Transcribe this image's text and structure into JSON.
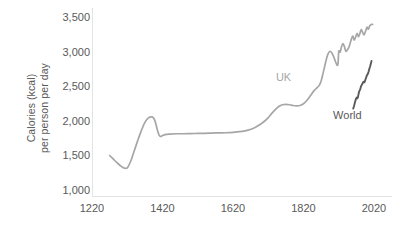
{
  "chart_data": {
    "type": "line",
    "title": "",
    "subtitle": "",
    "xlabel": "",
    "ylabel": "Calories (kcal) per person per day",
    "ylabel_line1": "Calories (kcal)",
    "ylabel_line2": "per person per day",
    "xlim": [
      1220,
      2020
    ],
    "ylim": [
      1000,
      3500
    ],
    "xticks": [
      1220,
      1420,
      1620,
      1820,
      2020
    ],
    "xtick_labels": [
      "1220",
      "1420",
      "1620",
      "1820",
      "2020"
    ],
    "yticks": [
      1000,
      1500,
      2000,
      2500,
      3000,
      3500
    ],
    "ytick_labels": [
      "1,000",
      "1,500",
      "2,000",
      "2,500",
      "3,000",
      "3,500"
    ],
    "grid": false,
    "legend_position": "inline-annotations",
    "series": [
      {
        "name": "UK",
        "color": "#a6a6a6",
        "label_x": 1770,
        "label_y": 2620,
        "x": [
          1270,
          1280,
          1290,
          1300,
          1310,
          1320,
          1330,
          1340,
          1350,
          1360,
          1370,
          1380,
          1390,
          1395,
          1400,
          1405,
          1410,
          1415,
          1420,
          1430,
          1440,
          1460,
          1480,
          1500,
          1520,
          1540,
          1560,
          1580,
          1600,
          1620,
          1640,
          1660,
          1680,
          1700,
          1710,
          1720,
          1730,
          1740,
          1750,
          1760,
          1770,
          1780,
          1790,
          1800,
          1810,
          1820,
          1830,
          1840,
          1850,
          1860,
          1865,
          1870,
          1875,
          1880,
          1885,
          1890,
          1895,
          1900,
          1905,
          1910,
          1915,
          1918,
          1920,
          1924,
          1928,
          1932,
          1936,
          1940,
          1944,
          1948,
          1952,
          1956,
          1960,
          1964,
          1968,
          1972,
          1976,
          1980,
          1984,
          1988,
          1992,
          1996,
          2000,
          2004,
          2008,
          2012,
          2016
        ],
        "y": [
          1500,
          1450,
          1400,
          1355,
          1320,
          1320,
          1420,
          1570,
          1720,
          1860,
          1980,
          2045,
          2060,
          2040,
          1980,
          1880,
          1800,
          1775,
          1790,
          1805,
          1810,
          1815,
          1815,
          1818,
          1820,
          1822,
          1825,
          1828,
          1830,
          1835,
          1845,
          1865,
          1900,
          1960,
          2000,
          2050,
          2110,
          2165,
          2210,
          2235,
          2240,
          2235,
          2225,
          2220,
          2225,
          2250,
          2300,
          2370,
          2440,
          2490,
          2520,
          2580,
          2680,
          2790,
          2900,
          2975,
          3010,
          2990,
          2940,
          2870,
          2810,
          2830,
          3010,
          3000,
          3080,
          3120,
          3080,
          3010,
          3030,
          3060,
          3120,
          3190,
          3230,
          3170,
          3220,
          3270,
          3220,
          3270,
          3330,
          3280,
          3250,
          3300,
          3360,
          3330,
          3380,
          3400,
          3400
        ]
      },
      {
        "name": "World",
        "color": "#595959",
        "label_x": 1955,
        "label_y": 2070,
        "x": [
          1961,
          1963,
          1965,
          1967,
          1969,
          1971,
          1973,
          1975,
          1977,
          1979,
          1981,
          1983,
          1985,
          1987,
          1989,
          1991,
          1993,
          1995,
          1997,
          1999,
          2001,
          2003,
          2005,
          2007,
          2009,
          2011,
          2013
        ],
        "y": [
          2180,
          2210,
          2250,
          2290,
          2320,
          2340,
          2330,
          2360,
          2410,
          2440,
          2460,
          2500,
          2520,
          2540,
          2560,
          2570,
          2560,
          2590,
          2620,
          2650,
          2670,
          2690,
          2720,
          2760,
          2790,
          2830,
          2870
        ]
      }
    ]
  },
  "colors": {
    "uk_line": "#a6a6a6",
    "world_line": "#595959",
    "axis_text": "#595959",
    "axis_line": "#e3e3e3",
    "background": "#ffffff"
  }
}
